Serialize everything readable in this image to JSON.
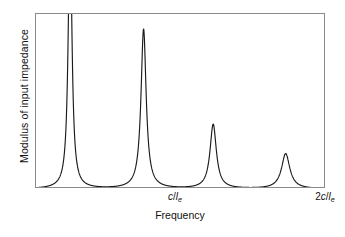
{
  "chart_data": {
    "type": "line",
    "title": "",
    "xlabel": "Frequency",
    "ylabel": "Modulus of input impedance",
    "grid": false,
    "legend": null,
    "xlim": [
      0,
      2
    ],
    "ylim": [
      0,
      1
    ],
    "x_tick_labels": [
      {
        "text": "c/l_e",
        "display_num": "",
        "display_c": "c",
        "display_slash": "/",
        "display_l": "l",
        "display_sub": "e",
        "x_value": 1.0
      },
      {
        "text": "2c/l_e",
        "display_num": "2",
        "display_c": "c",
        "display_slash": "/",
        "display_l": "l",
        "display_sub": "e",
        "x_value": 2.0
      }
    ],
    "series": [
      {
        "name": "Modulus of input impedance",
        "color": "#1a1a1a",
        "peaks": [
          {
            "index": 1,
            "x_value": 0.235,
            "amplitude": 1.55,
            "halfwidth": 0.0155,
            "clipped": true
          },
          {
            "index": 2,
            "x_value": 0.742,
            "amplitude": 0.93,
            "halfwidth": 0.0215,
            "clipped": false
          },
          {
            "index": 3,
            "x_value": 1.222,
            "amplitude": 0.375,
            "halfwidth": 0.0265,
            "clipped": false
          },
          {
            "index": 4,
            "x_value": 1.722,
            "amplitude": 0.205,
            "halfwidth": 0.0345,
            "clipped": false
          }
        ],
        "minima_x_values": [
          0.482,
          0.966,
          1.448,
          1.93
        ],
        "baseline_value": 0.0
      }
    ]
  },
  "axes": {
    "frame_color": "#8a8a8a",
    "curve_color": "#1a1a1a",
    "background": "#ffffff"
  }
}
